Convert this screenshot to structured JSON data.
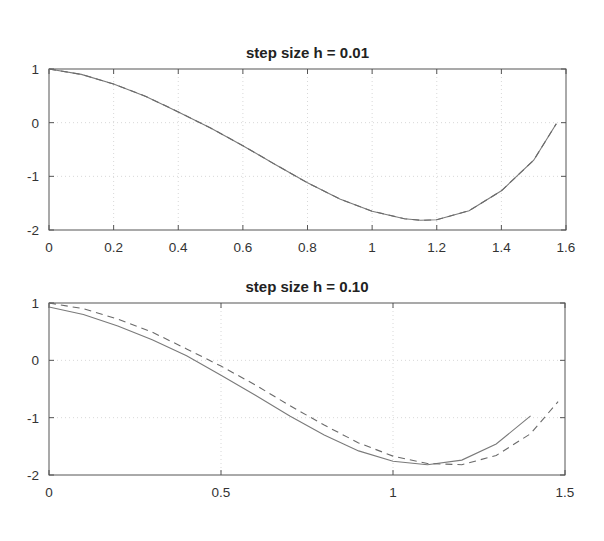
{
  "figure": {
    "background": "#ffffff",
    "axis_color": "#555555",
    "grid_color": "#d8d8d8",
    "line_color": "#7a7a7a"
  },
  "chart_data": [
    {
      "type": "line",
      "title": "step size h = 0.01",
      "xlabel": "",
      "ylabel": "",
      "xlim": [
        0,
        1.6
      ],
      "ylim": [
        -2,
        1
      ],
      "grid": true,
      "xticks": [
        "0",
        "0.2",
        "0.4",
        "0.6",
        "0.8",
        "1",
        "1.2",
        "1.4",
        "1.6"
      ],
      "xtick_values": [
        0,
        0.2,
        0.4,
        0.6,
        0.8,
        1.0,
        1.2,
        1.4,
        1.6
      ],
      "yticks": [
        "1",
        "0",
        "-1",
        "-2"
      ],
      "ytick_values": [
        1,
        0,
        -1,
        -2
      ],
      "series": [
        {
          "name": "numerical",
          "style": "solid",
          "x": [
            0,
            0.1,
            0.2,
            0.3,
            0.4,
            0.5,
            0.6,
            0.7,
            0.8,
            0.9,
            1.0,
            1.1,
            1.15,
            1.2,
            1.3,
            1.4,
            1.5,
            1.57
          ],
          "y": [
            1.0,
            0.9,
            0.72,
            0.49,
            0.2,
            -0.1,
            -0.43,
            -0.78,
            -1.12,
            -1.42,
            -1.65,
            -1.79,
            -1.82,
            -1.81,
            -1.64,
            -1.27,
            -0.7,
            -0.02
          ]
        },
        {
          "name": "exact",
          "style": "dashed",
          "x": [
            0,
            0.1,
            0.2,
            0.3,
            0.4,
            0.5,
            0.6,
            0.7,
            0.8,
            0.9,
            1.0,
            1.1,
            1.15,
            1.2,
            1.3,
            1.4,
            1.5,
            1.57
          ],
          "y": [
            1.0,
            0.9,
            0.72,
            0.49,
            0.2,
            -0.1,
            -0.43,
            -0.78,
            -1.12,
            -1.42,
            -1.65,
            -1.79,
            -1.82,
            -1.81,
            -1.64,
            -1.27,
            -0.7,
            -0.02
          ]
        }
      ]
    },
    {
      "type": "line",
      "title": "step size h = 0.10",
      "xlabel": "",
      "ylabel": "",
      "xlim": [
        0,
        1.5
      ],
      "ylim": [
        -2,
        1
      ],
      "grid": true,
      "xticks": [
        "0",
        "0.5",
        "1",
        "1.5"
      ],
      "xtick_values": [
        0,
        0.5,
        1.0,
        1.5
      ],
      "yticks": [
        "1",
        "0",
        "-1",
        "-2"
      ],
      "ytick_values": [
        1,
        0,
        -1,
        -2
      ],
      "series": [
        {
          "name": "numerical",
          "style": "solid",
          "x": [
            0,
            0.1,
            0.2,
            0.3,
            0.4,
            0.5,
            0.6,
            0.7,
            0.8,
            0.9,
            1.0,
            1.1,
            1.2,
            1.3,
            1.4
          ],
          "y": [
            0.93,
            0.8,
            0.6,
            0.36,
            0.08,
            -0.26,
            -0.61,
            -0.97,
            -1.3,
            -1.58,
            -1.76,
            -1.82,
            -1.74,
            -1.46,
            -0.97
          ]
        },
        {
          "name": "exact",
          "style": "dashed",
          "x": [
            0,
            0.1,
            0.2,
            0.3,
            0.4,
            0.5,
            0.6,
            0.7,
            0.8,
            0.9,
            1.0,
            1.1,
            1.2,
            1.3,
            1.4,
            1.48
          ],
          "y": [
            1.0,
            0.9,
            0.72,
            0.49,
            0.2,
            -0.1,
            -0.43,
            -0.79,
            -1.13,
            -1.44,
            -1.67,
            -1.8,
            -1.82,
            -1.66,
            -1.28,
            -0.72
          ]
        }
      ]
    }
  ]
}
